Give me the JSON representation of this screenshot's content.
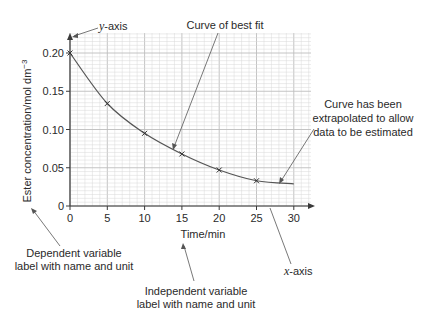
{
  "chart_data": {
    "type": "line",
    "title": "",
    "xlabel": "Time/min",
    "ylabel": "Ester concentration/mol dm",
    "ylabel_superscript": "−3",
    "xlim": [
      0,
      30
    ],
    "ylim": [
      0,
      0.2
    ],
    "grid": true,
    "x_ticks": [
      0,
      5,
      10,
      15,
      20,
      25,
      30
    ],
    "x_tick_labels": [
      "0",
      "5",
      "10",
      "15",
      "20",
      "25",
      "30"
    ],
    "y_ticks": [
      0,
      0.05,
      0.1,
      0.15,
      0.2
    ],
    "y_tick_labels": [
      "0",
      "0.05",
      "0.10",
      "0.15",
      "0.20"
    ],
    "series": [
      {
        "name": "Measured points",
        "marker": "x",
        "x": [
          0,
          5,
          10,
          15,
          20,
          25
        ],
        "y": [
          0.2,
          0.134,
          0.095,
          0.068,
          0.047,
          0.033
        ]
      },
      {
        "name": "Curve of best fit",
        "marker": "none",
        "x": [
          0,
          5,
          10,
          15,
          20,
          25,
          30
        ],
        "y": [
          0.2,
          0.134,
          0.095,
          0.068,
          0.047,
          0.033,
          0.029
        ]
      }
    ],
    "annotations": [
      {
        "id": "y-axis",
        "italic_prefix": "y",
        "text": "-axis"
      },
      {
        "id": "best-fit",
        "text": "Curve of best fit"
      },
      {
        "id": "extrapolated",
        "lines": [
          "Curve has been",
          "extrapolated to allow",
          "data to be estimated"
        ]
      },
      {
        "id": "x-axis",
        "italic_prefix": "x",
        "text": "-axis"
      },
      {
        "id": "dependent",
        "lines": [
          "Dependent variable",
          "label with name and unit"
        ]
      },
      {
        "id": "independent",
        "lines": [
          "Independent variable",
          "label with name and unit"
        ]
      }
    ]
  },
  "colors": {
    "grid_minor": "#d9d9d9",
    "grid_major": "#bdbdbd",
    "axis": "#3a3a3a",
    "curve": "#555555",
    "text": "#2a2a2a"
  }
}
